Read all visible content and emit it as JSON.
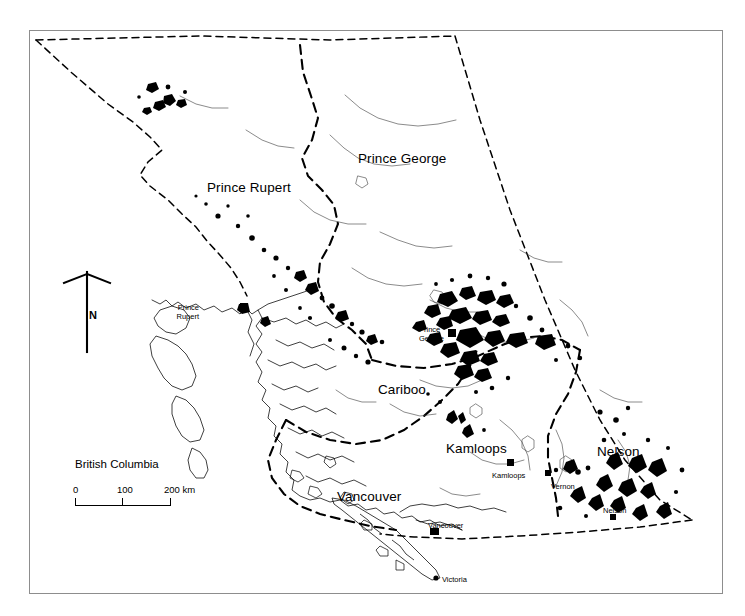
{
  "figure": {
    "title": "British Columbia",
    "frame": {
      "stroke": "#8d8d8d",
      "background": "#ffffff"
    }
  },
  "scalebar": {
    "title": "British Columbia",
    "labels": [
      "0",
      "100",
      "200 km"
    ],
    "unit": "km",
    "max_value": 200
  },
  "compass": {
    "label": "N",
    "name": "north-arrow"
  },
  "regions": [
    {
      "id": "prince-rupert",
      "label": "Prince Rupert",
      "x": 207,
      "y": 180
    },
    {
      "id": "prince-george",
      "label": "Prince George",
      "x": 358,
      "y": 151
    },
    {
      "id": "cariboo",
      "label": "Cariboo",
      "x": 378,
      "y": 382
    },
    {
      "id": "kamloops",
      "label": "Kamloops",
      "x": 446,
      "y": 441
    },
    {
      "id": "nelson",
      "label": "Nelson",
      "x": 597,
      "y": 444
    },
    {
      "id": "vancouver",
      "label": "Vancouver",
      "x": 337,
      "y": 489
    }
  ],
  "cities": [
    {
      "id": "prince-rupert",
      "lines": [
        "Prince",
        "Rupert"
      ],
      "label_x": 199,
      "label_y": 304,
      "align": "right",
      "marker_x": 244,
      "marker_y": 307,
      "marker": "square"
    },
    {
      "id": "prince-george",
      "lines": [
        "Prince",
        "George"
      ],
      "label_x": 419,
      "label_y": 326,
      "align": "left",
      "marker_x": 452,
      "marker_y": 333,
      "marker": "square"
    },
    {
      "id": "kamloops",
      "lines": [
        "Kamloops"
      ],
      "label_x": 492,
      "label_y": 472,
      "align": "left",
      "marker_x": 511,
      "marker_y": 463,
      "marker": "square"
    },
    {
      "id": "vernon",
      "lines": [
        "Vernon"
      ],
      "label_x": 551,
      "label_y": 483,
      "align": "left",
      "marker_x": 548,
      "marker_y": 473,
      "marker": "square"
    },
    {
      "id": "nelson",
      "lines": [
        "Nelson"
      ],
      "label_x": 603,
      "label_y": 507,
      "align": "left",
      "marker_x": 613,
      "marker_y": 517,
      "marker": "square"
    },
    {
      "id": "vancouver",
      "lines": [
        "Vancouver"
      ],
      "label_x": 428,
      "label_y": 522,
      "align": "left",
      "marker_x": 436,
      "marker_y": 531,
      "marker": "square"
    },
    {
      "id": "victoria",
      "lines": [
        "Victoria"
      ],
      "label_x": 442,
      "label_y": 576,
      "align": "left",
      "marker_x": 436,
      "marker_y": 578,
      "marker": "dot"
    }
  ],
  "legend_note": "Black polygons indicate mapped disturbance patches"
}
